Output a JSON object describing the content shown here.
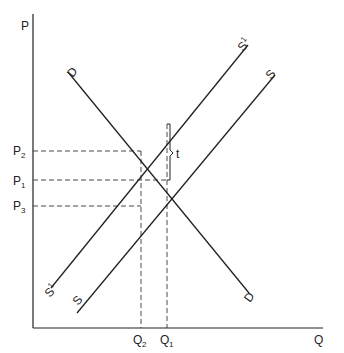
{
  "axes": {
    "y_label": "P",
    "x_label": "Q"
  },
  "curves": {
    "demand": {
      "label_start": "D",
      "label_end": "D"
    },
    "supply": {
      "label_start": "S",
      "label_end": "S"
    },
    "supply_taxed": {
      "label_start": "S",
      "label_end": "S",
      "superscript": "1"
    }
  },
  "price_levels": [
    {
      "base": "P",
      "sub": "2"
    },
    {
      "base": "P",
      "sub": "1"
    },
    {
      "base": "P",
      "sub": "3"
    }
  ],
  "quantity_levels": [
    {
      "base": "Q",
      "sub": "2"
    },
    {
      "base": "Q",
      "sub": "1"
    }
  ],
  "tax_label": "t",
  "colors": {
    "line": "#222222",
    "background": "#ffffff"
  }
}
